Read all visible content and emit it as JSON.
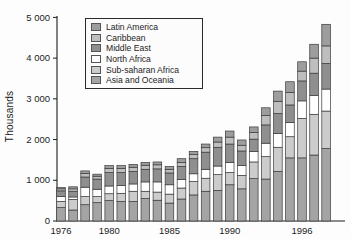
{
  "chart_data": {
    "type": "bar",
    "stacked": true,
    "title": "",
    "xlabel": "",
    "ylabel": "Thousands",
    "ylim": [
      0,
      5000
    ],
    "grid": false,
    "legend_position": "top-left-inside",
    "ytick_values": [
      0,
      1000,
      2000,
      3000,
      4000,
      5000
    ],
    "ytick_labels": [
      "0",
      "1 000",
      "2 000",
      "3 000",
      "4 000",
      "5 000"
    ],
    "xtick_years": [
      1976,
      1980,
      1985,
      1990,
      1996
    ],
    "categories": [
      1976,
      1977,
      1978,
      1979,
      1980,
      1981,
      1982,
      1983,
      1984,
      1985,
      1986,
      1987,
      1988,
      1989,
      1990,
      1991,
      1992,
      1993,
      1994,
      1995,
      1996,
      1997,
      1998
    ],
    "stack_order": "bottom-to-top",
    "series": [
      {
        "name": "Asia and Oceania",
        "color": "#a4a4a4",
        "values": [
          330,
          270,
          400,
          450,
          500,
          480,
          480,
          550,
          510,
          440,
          540,
          640,
          730,
          750,
          890,
          790,
          1040,
          1030,
          1220,
          1550,
          1550,
          1620,
          1780
        ]
      },
      {
        "name": "Sub-saharan Africa",
        "color": "#cccccc",
        "values": [
          150,
          260,
          200,
          150,
          170,
          200,
          250,
          180,
          200,
          220,
          270,
          330,
          320,
          390,
          300,
          330,
          410,
          550,
          590,
          520,
          970,
          1000,
          920
        ]
      },
      {
        "name": "North Africa",
        "color": "#ffffff",
        "values": [
          120,
          60,
          230,
          180,
          190,
          190,
          180,
          230,
          250,
          230,
          210,
          190,
          220,
          210,
          250,
          240,
          260,
          330,
          340,
          350,
          430,
          460,
          540
        ]
      },
      {
        "name": "Middle East",
        "color": "#8f8f8f",
        "values": [
          140,
          140,
          250,
          250,
          330,
          320,
          310,
          310,
          320,
          290,
          320,
          370,
          420,
          460,
          450,
          360,
          300,
          450,
          490,
          430,
          490,
          550,
          630
        ]
      },
      {
        "name": "Caribbean",
        "color": "#bebebe",
        "values": [
          50,
          60,
          90,
          70,
          100,
          100,
          100,
          100,
          100,
          90,
          100,
          100,
          110,
          130,
          170,
          140,
          160,
          230,
          300,
          310,
          240,
          370,
          430
        ]
      },
      {
        "name": "Latin America",
        "color": "#9d9d9d",
        "values": [
          30,
          50,
          60,
          50,
          70,
          70,
          70,
          70,
          70,
          70,
          90,
          80,
          90,
          120,
          150,
          130,
          140,
          190,
          250,
          260,
          230,
          340,
          530
        ]
      }
    ],
    "totals": [
      820,
      840,
      1230,
      1150,
      1360,
      1360,
      1390,
      1440,
      1450,
      1340,
      1530,
      1710,
      1890,
      2060,
      2210,
      1990,
      2310,
      2780,
      3190,
      3420,
      3910,
      4340,
      4830
    ]
  }
}
